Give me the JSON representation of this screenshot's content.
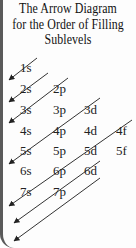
{
  "title": {
    "line1": "The Arrow Diagram",
    "line2": "for the Order of Filling",
    "line3": "Sublevels"
  },
  "sublevels": [
    {
      "label": "1s",
      "x": 20,
      "y": 72
    },
    {
      "label": "2s",
      "x": 20,
      "y": 93
    },
    {
      "label": "2p",
      "x": 53,
      "y": 93
    },
    {
      "label": "3s",
      "x": 20,
      "y": 114
    },
    {
      "label": "3p",
      "x": 53,
      "y": 114
    },
    {
      "label": "3d",
      "x": 84,
      "y": 114
    },
    {
      "label": "4s",
      "x": 20,
      "y": 135
    },
    {
      "label": "4p",
      "x": 53,
      "y": 135
    },
    {
      "label": "4d",
      "x": 84,
      "y": 135
    },
    {
      "label": "4f",
      "x": 116,
      "y": 135
    },
    {
      "label": "5s",
      "x": 20,
      "y": 155
    },
    {
      "label": "5p",
      "x": 53,
      "y": 155
    },
    {
      "label": "5d",
      "x": 84,
      "y": 155
    },
    {
      "label": "5f",
      "x": 116,
      "y": 155
    },
    {
      "label": "6s",
      "x": 20,
      "y": 175
    },
    {
      "label": "6p",
      "x": 53,
      "y": 175
    },
    {
      "label": "6d",
      "x": 84,
      "y": 175
    },
    {
      "label": "7s",
      "x": 20,
      "y": 196
    },
    {
      "label": "7p",
      "x": 53,
      "y": 196
    }
  ],
  "arrows": [
    {
      "x1": 37,
      "y1": 58,
      "x2": 9,
      "y2": 80
    },
    {
      "x1": 48,
      "y1": 73,
      "x2": 9,
      "y2": 102
    },
    {
      "x1": 68,
      "y1": 78,
      "x2": 9,
      "y2": 123
    },
    {
      "x1": 100,
      "y1": 98,
      "x2": 9,
      "y2": 164
    },
    {
      "x1": 132,
      "y1": 120,
      "x2": 9,
      "y2": 206
    },
    {
      "x1": 100,
      "y1": 161,
      "x2": 14,
      "y2": 223
    },
    {
      "x1": 100,
      "y1": 178,
      "x2": 14,
      "y2": 241
    }
  ],
  "colors": {
    "text": "#222222",
    "arrow": "#333333",
    "border": "#5a5a5a"
  }
}
